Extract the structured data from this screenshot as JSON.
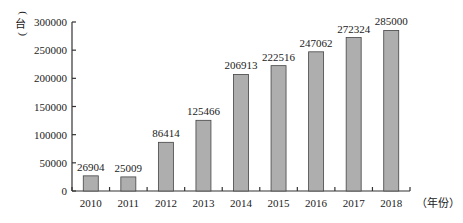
{
  "chart_data": {
    "type": "bar",
    "title": "",
    "xlabel": "（年份）",
    "ylabel": "（台）",
    "categories": [
      "2010",
      "2011",
      "2012",
      "2013",
      "2014",
      "2015",
      "2016",
      "2017",
      "2018"
    ],
    "values": [
      26904,
      25009,
      86414,
      125466,
      206913,
      222516,
      247062,
      272324,
      285000
    ],
    "data_labels": [
      "26904",
      "25009",
      "86414",
      "125466",
      "206913",
      "222516",
      "247062",
      "272324",
      "285000"
    ],
    "ylim": [
      0,
      300000
    ],
    "yticks": [
      0,
      50000,
      100000,
      150000,
      200000,
      250000,
      300000
    ],
    "ytick_labels": [
      "0",
      "50000",
      "100000",
      "150000",
      "200000",
      "250000",
      "300000"
    ],
    "grid": false,
    "legend": null,
    "colors": {
      "bar_fill": "#aeaeae",
      "bar_stroke": "#444444",
      "axis": "#333333"
    }
  }
}
